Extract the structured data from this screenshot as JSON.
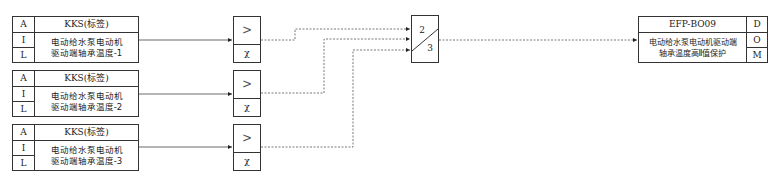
{
  "inputs": [
    {
      "col_a": "A",
      "col_i": "I",
      "col_l": "L",
      "tag": "KKS(标签)",
      "description": "电动给水泵电动机\n驱动端轴承温度-1"
    },
    {
      "col_a": "A",
      "col_i": "I",
      "col_l": "L",
      "tag": "KKS(标签)",
      "description": "电动给水泵电动机\n驱动端轴承温度-2"
    },
    {
      "col_a": "A",
      "col_i": "I",
      "col_l": "L",
      "tag": "KKS(标签)",
      "description": "电动给水泵电动机\n驱动端轴承温度-3"
    }
  ],
  "comparators": [
    {
      "op": ">",
      "setpoint": "χ"
    },
    {
      "op": ">",
      "setpoint": "χ"
    },
    {
      "op": ">",
      "setpoint": "χ"
    }
  ],
  "voter": {
    "top": "2",
    "bottom": "3"
  },
  "output": {
    "tag": "EFP-BO09",
    "description": "电动给水泵电动机驱动端\n轴承温度高Ⅱ值保护",
    "col_d": "D",
    "col_o": "O",
    "col_m": "M"
  },
  "colors": {
    "line": "#333333",
    "dashed": "#555555",
    "background": "#ffffff"
  }
}
